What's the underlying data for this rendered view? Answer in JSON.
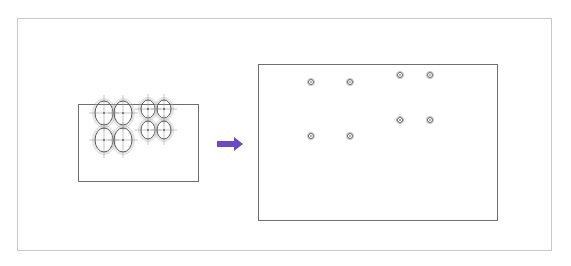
{
  "diagram": {
    "title": "",
    "outer_frame": {
      "x": 17,
      "y": 18,
      "w": 535,
      "h": 233,
      "stroke": "#c8c8c8"
    },
    "source_panel": {
      "label": "",
      "rect": {
        "x": 78,
        "y": 104,
        "w": 120,
        "h": 77,
        "stroke": "#6e6e6e"
      },
      "large_ellipses": [
        {
          "cx": 104,
          "cy": 113,
          "rx": 9,
          "ry": 12
        },
        {
          "cx": 123,
          "cy": 113,
          "rx": 9,
          "ry": 12
        },
        {
          "cx": 104,
          "cy": 140,
          "rx": 9,
          "ry": 12
        },
        {
          "cx": 123,
          "cy": 140,
          "rx": 9,
          "ry": 12
        }
      ],
      "small_ellipses": [
        {
          "cx": 148,
          "cy": 109,
          "rx": 7,
          "ry": 9
        },
        {
          "cx": 164,
          "cy": 109,
          "rx": 7,
          "ry": 9
        },
        {
          "cx": 148,
          "cy": 130,
          "rx": 7,
          "ry": 9
        },
        {
          "cx": 164,
          "cy": 130,
          "rx": 7,
          "ry": 9
        }
      ]
    },
    "arrow": {
      "x1": 217,
      "x2": 243,
      "y": 144,
      "color": "#6a4bc4"
    },
    "target_panel": {
      "label": "",
      "rect": {
        "x": 258,
        "y": 64,
        "w": 239,
        "h": 156,
        "stroke": "#6e6e6e"
      },
      "markers": [
        {
          "cx": 311,
          "cy": 82
        },
        {
          "cx": 350,
          "cy": 82
        },
        {
          "cx": 400,
          "cy": 75
        },
        {
          "cx": 430,
          "cy": 75
        },
        {
          "cx": 400,
          "cy": 120
        },
        {
          "cx": 430,
          "cy": 120
        },
        {
          "cx": 311,
          "cy": 136
        },
        {
          "cx": 350,
          "cy": 136
        }
      ]
    },
    "colors": {
      "line": "#6e6e6e",
      "ellipse": "#555555",
      "ellipse_halo": "#b4b4b4",
      "crosshair": "#a0a0a0",
      "marker": "#666666"
    }
  }
}
